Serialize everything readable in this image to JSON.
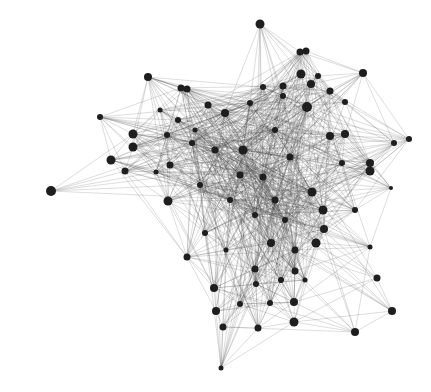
{
  "diagram": {
    "type": "network-graph",
    "width": 431,
    "height": 392,
    "background": "#ffffff",
    "node_color": "#1e1e1e",
    "edge_color": "#3a3a3a",
    "nodes": [
      {
        "id": 0,
        "x": 51,
        "y": 191,
        "r": 5
      },
      {
        "id": 1,
        "x": 100,
        "y": 117,
        "r": 3
      },
      {
        "id": 2,
        "x": 111,
        "y": 160,
        "r": 4.5
      },
      {
        "id": 3,
        "x": 125,
        "y": 171,
        "r": 3.5
      },
      {
        "id": 4,
        "x": 133,
        "y": 134,
        "r": 4.5
      },
      {
        "id": 5,
        "x": 133,
        "y": 147,
        "r": 4.5
      },
      {
        "id": 6,
        "x": 148,
        "y": 77,
        "r": 4
      },
      {
        "id": 7,
        "x": 156,
        "y": 172,
        "r": 2.5
      },
      {
        "id": 8,
        "x": 167,
        "y": 135,
        "r": 3
      },
      {
        "id": 9,
        "x": 170,
        "y": 165,
        "r": 3.5
      },
      {
        "id": 10,
        "x": 168,
        "y": 201,
        "r": 4.5
      },
      {
        "id": 11,
        "x": 181,
        "y": 88,
        "r": 3.5
      },
      {
        "id": 12,
        "x": 187,
        "y": 89,
        "r": 3.5
      },
      {
        "id": 13,
        "x": 178,
        "y": 120,
        "r": 3
      },
      {
        "id": 14,
        "x": 192,
        "y": 143,
        "r": 3
      },
      {
        "id": 15,
        "x": 208,
        "y": 105,
        "r": 3.5
      },
      {
        "id": 16,
        "x": 225,
        "y": 113,
        "r": 4
      },
      {
        "id": 17,
        "x": 260,
        "y": 24,
        "r": 4.5
      },
      {
        "id": 18,
        "x": 300,
        "y": 52,
        "r": 3.5
      },
      {
        "id": 19,
        "x": 306,
        "y": 51,
        "r": 3.5
      },
      {
        "id": 20,
        "x": 301,
        "y": 74,
        "r": 4.5
      },
      {
        "id": 21,
        "x": 311,
        "y": 84,
        "r": 4
      },
      {
        "id": 22,
        "x": 318,
        "y": 76,
        "r": 3
      },
      {
        "id": 23,
        "x": 363,
        "y": 73,
        "r": 4
      },
      {
        "id": 24,
        "x": 263,
        "y": 87,
        "r": 3
      },
      {
        "id": 25,
        "x": 283,
        "y": 86,
        "r": 3.5
      },
      {
        "id": 26,
        "x": 330,
        "y": 91,
        "r": 3.5
      },
      {
        "id": 27,
        "x": 250,
        "y": 103,
        "r": 3
      },
      {
        "id": 28,
        "x": 283,
        "y": 96,
        "r": 3
      },
      {
        "id": 29,
        "x": 307,
        "y": 107,
        "r": 5
      },
      {
        "id": 30,
        "x": 330,
        "y": 136,
        "r": 4
      },
      {
        "id": 31,
        "x": 345,
        "y": 134,
        "r": 4
      },
      {
        "id": 32,
        "x": 394,
        "y": 143,
        "r": 3
      },
      {
        "id": 33,
        "x": 409,
        "y": 139,
        "r": 3
      },
      {
        "id": 34,
        "x": 370,
        "y": 163,
        "r": 4
      },
      {
        "id": 35,
        "x": 370,
        "y": 171,
        "r": 4.5
      },
      {
        "id": 36,
        "x": 391,
        "y": 188,
        "r": 2
      },
      {
        "id": 37,
        "x": 243,
        "y": 150,
        "r": 4.5
      },
      {
        "id": 38,
        "x": 215,
        "y": 150,
        "r": 3.5
      },
      {
        "id": 39,
        "x": 240,
        "y": 175,
        "r": 3.5
      },
      {
        "id": 40,
        "x": 263,
        "y": 177,
        "r": 3.5
      },
      {
        "id": 41,
        "x": 290,
        "y": 157,
        "r": 3.5
      },
      {
        "id": 42,
        "x": 275,
        "y": 200,
        "r": 3.5
      },
      {
        "id": 43,
        "x": 312,
        "y": 192,
        "r": 4.5
      },
      {
        "id": 44,
        "x": 323,
        "y": 210,
        "r": 4.5
      },
      {
        "id": 45,
        "x": 316,
        "y": 243,
        "r": 4.5
      },
      {
        "id": 46,
        "x": 324,
        "y": 229,
        "r": 4
      },
      {
        "id": 47,
        "x": 355,
        "y": 210,
        "r": 3
      },
      {
        "id": 48,
        "x": 370,
        "y": 247,
        "r": 2.5
      },
      {
        "id": 49,
        "x": 271,
        "y": 243,
        "r": 4
      },
      {
        "id": 50,
        "x": 295,
        "y": 250,
        "r": 3.5
      },
      {
        "id": 51,
        "x": 205,
        "y": 233,
        "r": 3
      },
      {
        "id": 52,
        "x": 187,
        "y": 257,
        "r": 3.5
      },
      {
        "id": 53,
        "x": 255,
        "y": 269,
        "r": 3.5
      },
      {
        "id": 54,
        "x": 256,
        "y": 284,
        "r": 3
      },
      {
        "id": 55,
        "x": 281,
        "y": 280,
        "r": 3
      },
      {
        "id": 56,
        "x": 295,
        "y": 271,
        "r": 3.5
      },
      {
        "id": 57,
        "x": 214,
        "y": 288,
        "r": 4
      },
      {
        "id": 58,
        "x": 216,
        "y": 311,
        "r": 4
      },
      {
        "id": 59,
        "x": 240,
        "y": 304,
        "r": 3
      },
      {
        "id": 60,
        "x": 270,
        "y": 303,
        "r": 3
      },
      {
        "id": 61,
        "x": 294,
        "y": 302,
        "r": 4
      },
      {
        "id": 62,
        "x": 377,
        "y": 278,
        "r": 3.5
      },
      {
        "id": 63,
        "x": 392,
        "y": 311,
        "r": 4
      },
      {
        "id": 64,
        "x": 294,
        "y": 322,
        "r": 4.5
      },
      {
        "id": 65,
        "x": 223,
        "y": 327,
        "r": 3.5
      },
      {
        "id": 66,
        "x": 258,
        "y": 328,
        "r": 3.5
      },
      {
        "id": 67,
        "x": 355,
        "y": 332,
        "r": 4
      },
      {
        "id": 68,
        "x": 221,
        "y": 368,
        "r": 2.5
      },
      {
        "id": 69,
        "x": 230,
        "y": 200,
        "r": 3
      },
      {
        "id": 70,
        "x": 200,
        "y": 185,
        "r": 3
      },
      {
        "id": 71,
        "x": 255,
        "y": 215,
        "r": 3
      },
      {
        "id": 72,
        "x": 285,
        "y": 220,
        "r": 3
      },
      {
        "id": 73,
        "x": 226,
        "y": 250,
        "r": 2.5
      },
      {
        "id": 74,
        "x": 342,
        "y": 163,
        "r": 3
      },
      {
        "id": 75,
        "x": 345,
        "y": 102,
        "r": 3
      },
      {
        "id": 76,
        "x": 275,
        "y": 130,
        "r": 3
      },
      {
        "id": 77,
        "x": 195,
        "y": 130,
        "r": 2.5
      },
      {
        "id": 78,
        "x": 160,
        "y": 110,
        "r": 2.5
      },
      {
        "id": 79,
        "x": 305,
        "y": 280,
        "r": 2.5
      }
    ],
    "hub_ids": [
      16,
      37,
      38,
      39,
      40,
      41,
      42,
      43,
      69,
      70,
      71,
      72,
      29,
      76,
      14,
      27
    ],
    "edge_density": 0.28
  }
}
